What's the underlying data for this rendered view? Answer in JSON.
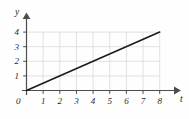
{
  "figure": {
    "background_color": "#fefefe",
    "width": 189,
    "height": 119
  },
  "chart_data": {
    "type": "line",
    "title": "",
    "subtitle": "",
    "xlabel": "t",
    "ylabel": "y",
    "xlim": [
      0,
      8.6
    ],
    "ylim": [
      0,
      4.6
    ],
    "xticks": [
      1,
      2,
      3,
      4,
      5,
      6,
      7,
      8
    ],
    "yticks": [
      1,
      2,
      3,
      4
    ],
    "xtick_labels": [
      "1",
      "2",
      "3",
      "4",
      "5",
      "6",
      "7",
      "8"
    ],
    "ytick_labels": [
      "1",
      "2",
      "3",
      "4"
    ],
    "origin_label": "0",
    "grid": true,
    "grid_color": "#d9d9d9",
    "axis_color": "#4d4d4d",
    "legend": null,
    "annotations": [],
    "series": [
      {
        "name": "line",
        "color": "#1a1a1a",
        "linewidth": 1.6,
        "x": [
          0,
          1,
          2,
          3,
          4,
          5,
          6,
          7,
          8
        ],
        "y": [
          0,
          0.5,
          1,
          1.5,
          2,
          2.5,
          3,
          3.5,
          4
        ],
        "slope": 0.5,
        "intercept": 0,
        "endpoints": [
          [
            0,
            0
          ],
          [
            8,
            4
          ]
        ]
      }
    ]
  }
}
